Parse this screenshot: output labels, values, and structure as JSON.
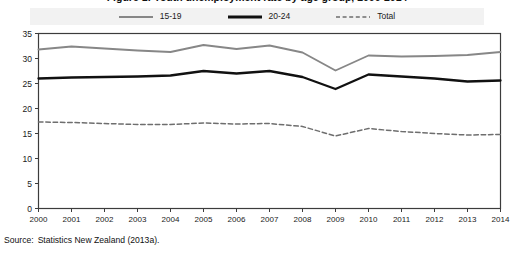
{
  "figure": {
    "title": "Figure 1: Youth unemployment rate by age group, 2000-2014",
    "source_label": "Source:",
    "source_text": "Statistics New Zealand (2013a)."
  },
  "legend": {
    "items": [
      {
        "label": "15-19",
        "style": "solid",
        "color": "#878787"
      },
      {
        "label": "20-24",
        "style": "solid",
        "color": "#111111"
      },
      {
        "label": "Total",
        "style": "dashed",
        "color": "#6e6e6e"
      }
    ]
  },
  "chart_data": {
    "type": "line",
    "title": "Figure 1: Youth unemployment rate by age group, 2000-2014",
    "xlabel": "",
    "ylabel": "",
    "x": [
      2000,
      2001,
      2002,
      2003,
      2004,
      2005,
      2006,
      2007,
      2008,
      2009,
      2010,
      2011,
      2012,
      2013,
      2014
    ],
    "categories": [
      "2000",
      "2001",
      "2002",
      "2003",
      "2004",
      "2005",
      "2006",
      "2007",
      "2008",
      "2009",
      "2010",
      "2011",
      "2012",
      "2013",
      "2014"
    ],
    "xlim": [
      2000,
      2014
    ],
    "ylim": [
      0,
      35
    ],
    "yticks": [
      0,
      5,
      10,
      15,
      20,
      25,
      30,
      35
    ],
    "grid": false,
    "legend_position": "top-center",
    "series": [
      {
        "name": "15-19",
        "color": "#878787",
        "style": "solid",
        "values": [
          31.8,
          32.4,
          32.0,
          31.6,
          31.3,
          32.7,
          31.9,
          32.6,
          31.2,
          27.6,
          30.6,
          30.4,
          30.5,
          30.7,
          31.3
        ]
      },
      {
        "name": "20-24",
        "color": "#111111",
        "style": "solid",
        "values": [
          26.0,
          26.2,
          26.3,
          26.4,
          26.6,
          27.5,
          27.0,
          27.5,
          26.3,
          23.9,
          26.8,
          26.4,
          26.0,
          25.4,
          25.6
        ]
      },
      {
        "name": "Total",
        "color": "#6e6e6e",
        "style": "dashed",
        "values": [
          17.3,
          17.2,
          17.0,
          16.8,
          16.8,
          17.1,
          16.9,
          17.0,
          16.4,
          14.5,
          16.0,
          15.4,
          15.0,
          14.7,
          14.8
        ]
      }
    ]
  },
  "axes": {
    "y_tick_labels": [
      "35",
      "30",
      "25",
      "20",
      "15",
      "10",
      "5",
      "0"
    ],
    "x_tick_labels": [
      "2000",
      "2001",
      "2002",
      "2003",
      "2004",
      "2005",
      "2006",
      "2007",
      "2008",
      "2009",
      "2010",
      "2011",
      "2012",
      "2013",
      "2014"
    ]
  },
  "colors": {
    "frame": "#3c3c3c",
    "legend_band": "#f2f2f2",
    "series_15_19": "#878787",
    "series_20_24": "#111111",
    "series_total": "#6e6e6e",
    "background": "#ffffff"
  }
}
